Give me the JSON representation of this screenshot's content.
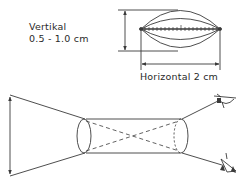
{
  "diagram": {
    "vertical_label": {
      "title": "Vertikal",
      "range": "0.5 - 1.0 cm"
    },
    "horizontal_label": "Horizontal  2 cm",
    "figures": [
      {
        "name": "lens-shape-top",
        "description": "biconvex lens outline with graduated horizontal axis"
      },
      {
        "name": "viewing-cylinder",
        "description": "cylinder with crossed dashed sight lines, funnel to object arrow on left, two eyes on right"
      }
    ],
    "colors": {
      "line": "#3a3a3a",
      "background": "#ffffff"
    }
  }
}
